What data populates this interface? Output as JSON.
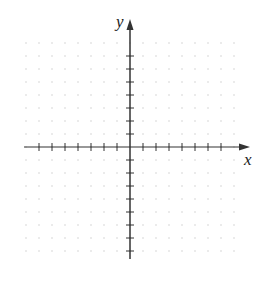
{
  "diagram": {
    "type": "coordinate-plane",
    "x_axis_label": "x",
    "y_axis_label": "y",
    "origin_px": [
      130,
      147
    ],
    "tick_spacing_px": 13,
    "x_ticks_left": 7,
    "x_ticks_right": 7,
    "y_ticks_up": 7,
    "y_ticks_down": 8,
    "grid": "dotted",
    "colors": {
      "axis": "#333333",
      "grid": "#c8c8c8",
      "label": "#222222"
    }
  }
}
